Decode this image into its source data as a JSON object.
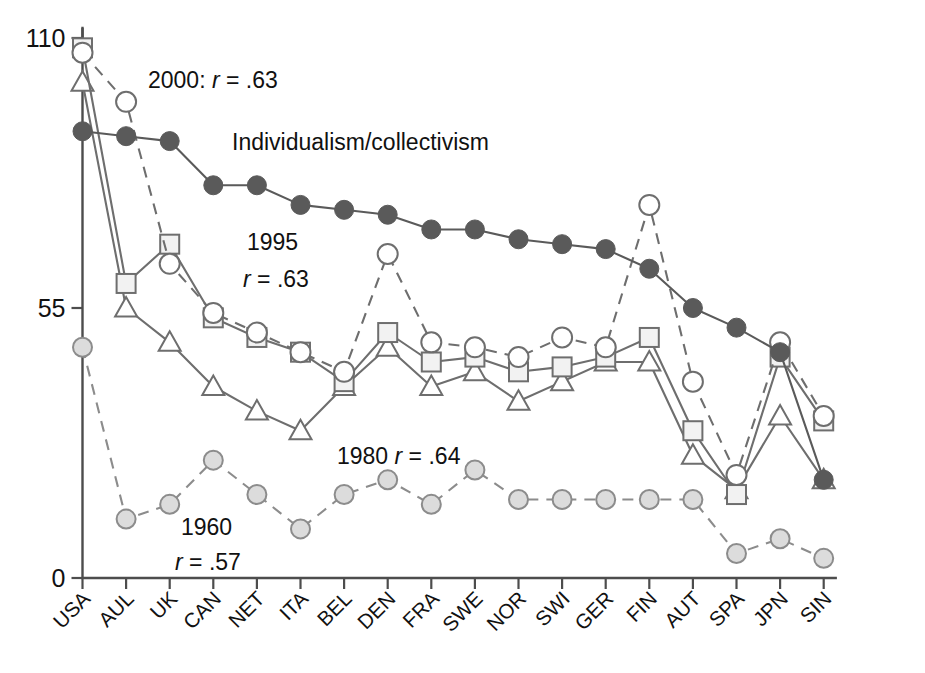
{
  "chart_data": {
    "type": "line",
    "title": "",
    "xlabel": "",
    "ylabel": "",
    "ylim": [
      0,
      110
    ],
    "yticks": [
      0,
      55,
      110
    ],
    "grid": false,
    "legend": "inline-annotations",
    "categories": [
      "USA",
      "AUL",
      "UK",
      "CAN",
      "NET",
      "ITA",
      "BEL",
      "DEN",
      "FRA",
      "SWE",
      "NOR",
      "SWI",
      "GER",
      "FIN",
      "AUT",
      "SPA",
      "JPN",
      "SIN"
    ],
    "series": [
      {
        "name": "Individualism/collectivism",
        "marker": "filled-circle",
        "line": "solid",
        "color": "#5a5a5a",
        "fill": "#5a5a5a",
        "values": [
          91,
          90,
          89,
          80,
          80,
          76,
          75,
          74,
          71,
          71,
          69,
          68,
          67,
          63,
          55,
          51,
          46,
          20
        ]
      },
      {
        "name": "2000",
        "label": "2000: r = .63",
        "marker": "open-circle",
        "line": "dashed",
        "color": "#6e6e6e",
        "fill": "#ffffff",
        "values": [
          107,
          97,
          64,
          54,
          50,
          46,
          42,
          66,
          48,
          47,
          45,
          49,
          47,
          76,
          40,
          21,
          48,
          33
        ]
      },
      {
        "name": "1995",
        "label": "1995 r = .63",
        "marker": "open-square",
        "line": "solid",
        "color": "#6e6e6e",
        "fill": "#f2f2f2",
        "values": [
          108,
          60,
          68,
          53,
          49,
          46,
          40,
          50,
          44,
          45,
          42,
          43,
          45,
          49,
          30,
          17,
          45,
          32
        ]
      },
      {
        "name": "1980",
        "label": "1980 r = .64",
        "marker": "open-triangle",
        "line": "solid",
        "color": "#6e6e6e",
        "fill": "#ffffff",
        "values": [
          101,
          55,
          48,
          39,
          34,
          30,
          39,
          47,
          39,
          42,
          36,
          40,
          44,
          44,
          25,
          18,
          33,
          20
        ]
      },
      {
        "name": "1960",
        "label": "1960 r = .57",
        "marker": "shaded-circle",
        "line": "dashed",
        "color": "#8c8c8c",
        "fill": "#dcdcdc",
        "values": [
          47,
          12,
          15,
          24,
          17,
          10,
          17,
          20,
          15,
          22,
          16,
          16,
          16,
          16,
          16,
          5,
          8,
          4
        ]
      }
    ],
    "annotations": [
      {
        "id": "annot-2000",
        "prefix": "2000: ",
        "italic": "r",
        "suffix": " = .63",
        "x": 148,
        "y": 88
      },
      {
        "id": "annot-indiv",
        "prefix": "Individualism/collectivism",
        "italic": "",
        "suffix": "",
        "x": 232,
        "y": 150
      },
      {
        "id": "annot-1995-line1",
        "prefix": "1995",
        "italic": "",
        "suffix": "",
        "x": 247,
        "y": 250
      },
      {
        "id": "annot-1995-line2",
        "prefix": "",
        "italic": "r",
        "suffix": " = .63",
        "x": 243,
        "y": 287
      },
      {
        "id": "annot-1980",
        "prefix": "1980 ",
        "italic": "r",
        "suffix": " = .64",
        "x": 337,
        "y": 464
      },
      {
        "id": "annot-1960-line1",
        "prefix": "1960",
        "italic": "",
        "suffix": "",
        "x": 181,
        "y": 535
      },
      {
        "id": "annot-1960-line2",
        "prefix": "",
        "italic": "r",
        "suffix": " = .57",
        "x": 175,
        "y": 570
      }
    ]
  },
  "axes": {
    "y_tick_labels": [
      "110",
      "55",
      "0"
    ],
    "x_tick_labels": [
      "USA",
      "AUL",
      "UK",
      "CAN",
      "NET",
      "ITA",
      "BEL",
      "DEN",
      "FRA",
      "SWE",
      "NOR",
      "SWI",
      "GER",
      "FIN",
      "AUT",
      "SPA",
      "JPN",
      "SIN"
    ]
  }
}
